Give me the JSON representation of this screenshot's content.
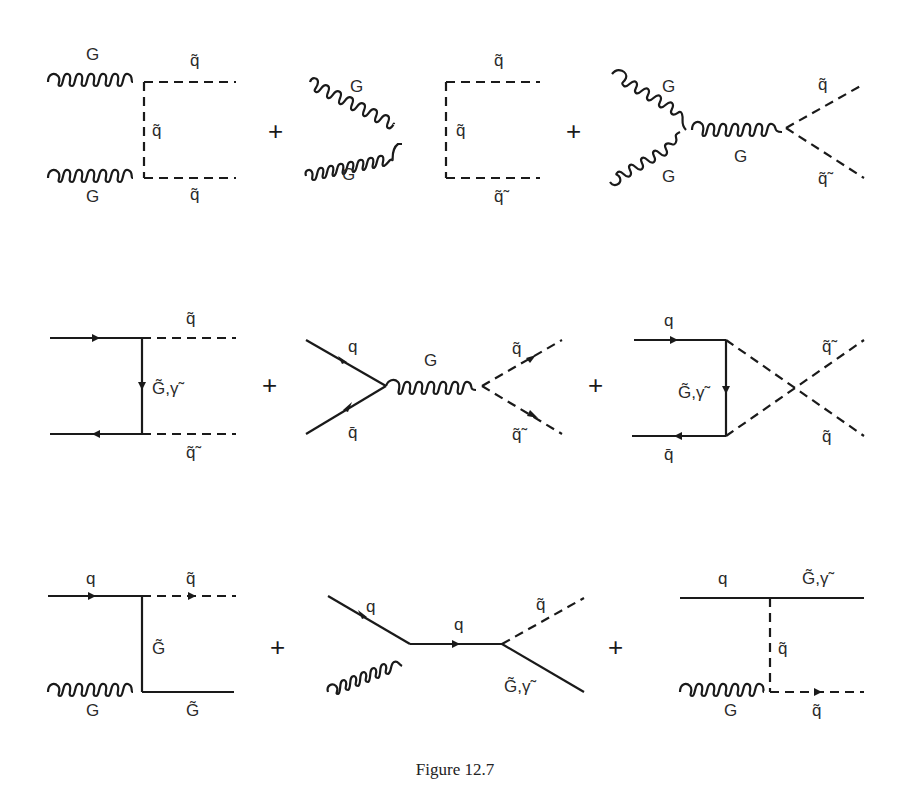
{
  "figure": {
    "caption": "Figure 12.7",
    "rows": [
      {
        "name": "gluon-gluon-to-squark-pair",
        "diagrams": [
          {
            "type": "t-channel",
            "incoming": [
              "G",
              "G"
            ],
            "propagator": "q̃",
            "outgoing": [
              "q̃",
              "q̃"
            ]
          },
          {
            "type": "u-channel",
            "incoming": [
              "G",
              "G"
            ],
            "propagator": "q̃",
            "outgoing": [
              "q̃",
              "q̃̃"
            ]
          },
          {
            "type": "s-channel",
            "incoming": [
              "G",
              "G"
            ],
            "propagator": "G",
            "outgoing": [
              "q̃",
              "q̃̃"
            ]
          }
        ]
      },
      {
        "name": "quark-antiquark-to-squark-pair",
        "diagrams": [
          {
            "type": "t-channel",
            "incoming": [
              "",
              ""
            ],
            "propagator": "G̃,γ̃",
            "outgoing": [
              "q̃",
              "q̃̃"
            ]
          },
          {
            "type": "s-channel",
            "incoming": [
              "q",
              "q̄"
            ],
            "propagator": "G",
            "outgoing": [
              "q̃",
              "q̃̃"
            ]
          },
          {
            "type": "u-channel",
            "incoming": [
              "q",
              "q̄"
            ],
            "propagator": "G̃,γ̃",
            "outgoing": [
              "q̃̃",
              "q̃"
            ]
          }
        ]
      },
      {
        "name": "quark-gluon-to-squark-gaugino",
        "diagrams": [
          {
            "type": "t-channel",
            "incoming": [
              "q",
              "G"
            ],
            "propagator": "G̃",
            "outgoing": [
              "q̃",
              "G̃"
            ]
          },
          {
            "type": "s-channel",
            "incoming": [
              "q",
              ""
            ],
            "propagator": "q",
            "outgoing": [
              "q̃",
              "G̃,γ̃"
            ]
          },
          {
            "type": "t-channel",
            "incoming": [
              "q",
              "G"
            ],
            "propagator": "q̃",
            "outgoing": [
              "G̃,γ̃",
              "q̃"
            ]
          }
        ]
      }
    ],
    "operator": "+"
  },
  "labels": {
    "G": "G",
    "q": "q",
    "qbar": "q̄",
    "sq": "q̃",
    "sqbar": "q̃̃",
    "gluino": "G̃",
    "gluino_photino": "G̃,γ̃",
    "plus": "+"
  }
}
